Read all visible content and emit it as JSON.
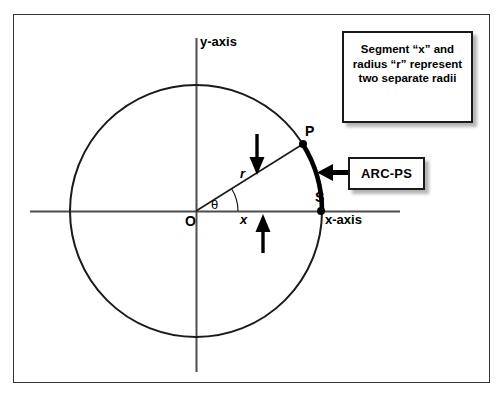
{
  "figure": {
    "title_note": "Segment “x” and radius “r” represent two separate radii",
    "note_lines": [
      "Segment “x” and",
      "radius “r”",
      "represent two",
      "separate radii"
    ],
    "arc_callout": "ARC-PS"
  },
  "axes": {
    "y_label": "y-axis",
    "x_label": "x-axis"
  },
  "points": {
    "origin": "O",
    "p": "P",
    "s": "S"
  },
  "segments": {
    "radius": "r",
    "chord_x": "x",
    "angle": "θ"
  },
  "colors": {
    "stroke": "#1a1a1a",
    "frame": "#333333",
    "axis": "#4d4d4d",
    "background": "#ffffff"
  },
  "geometry": {
    "center_x": 196,
    "center_y": 211,
    "radius_px": 126,
    "angle_deg": 32
  }
}
